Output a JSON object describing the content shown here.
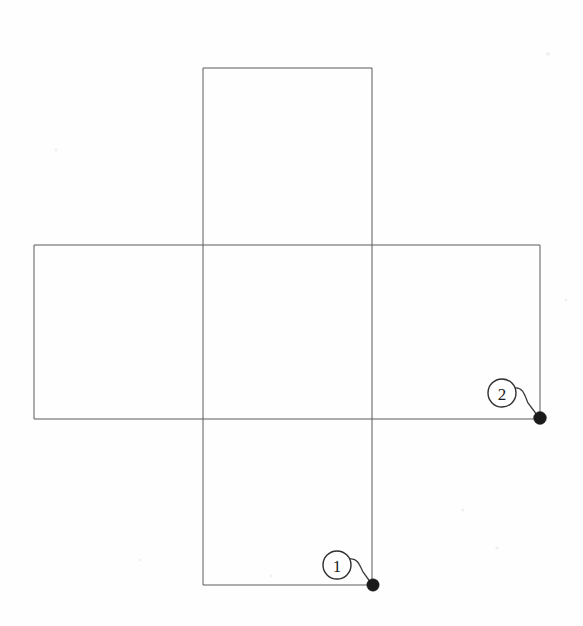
{
  "figure": {
    "background_color": "#fefefe",
    "line_color": "#5a5a5a",
    "marker_color": "#1a1a1a",
    "width": 583,
    "height": 626,
    "panels": [
      {
        "name": "vertical-panel",
        "label": "vertical rectangle",
        "x": 203,
        "y": 68,
        "width": 169,
        "height": 517
      },
      {
        "name": "horizontal-panel",
        "label": "horizontal rectangle",
        "x": 34,
        "y": 245,
        "width": 506,
        "height": 174
      }
    ],
    "callouts": [
      {
        "id": "callout-1",
        "number": "1",
        "circle_cx": 337,
        "circle_cy": 565,
        "circle_r": 14,
        "leader_path": "M 350,559 C 358,558 360,566 363,572 L 371,583",
        "dot_cx": 373,
        "dot_cy": 585,
        "dot_r": 6.2
      },
      {
        "id": "callout-2",
        "number": "2",
        "circle_cx": 502,
        "circle_cy": 393,
        "circle_r": 14,
        "leader_path": "M 515,388 C 523,387 525,396 528,403 L 537,415",
        "dot_cx": 540,
        "dot_cy": 418,
        "dot_r": 6.4
      }
    ],
    "specks": [
      {
        "cx": 548,
        "cy": 54,
        "r": 2.0
      },
      {
        "cx": 463,
        "cy": 510,
        "r": 1.6
      },
      {
        "cx": 271,
        "cy": 576,
        "r": 1.4
      },
      {
        "cx": 56,
        "cy": 150,
        "r": 1.5
      },
      {
        "cx": 497,
        "cy": 548,
        "r": 1.7
      },
      {
        "cx": 140,
        "cy": 560,
        "r": 1.3
      },
      {
        "cx": 566,
        "cy": 300,
        "r": 1.4
      }
    ]
  }
}
